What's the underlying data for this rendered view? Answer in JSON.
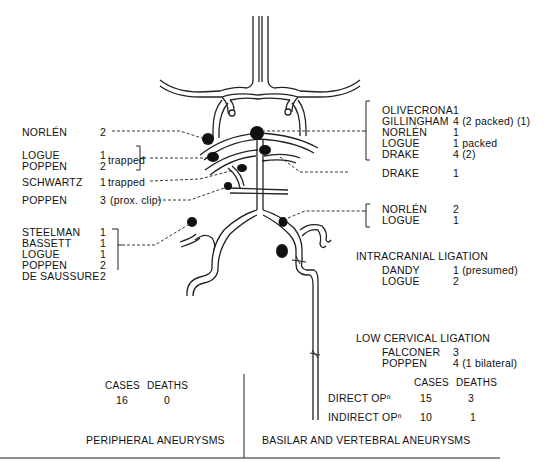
{
  "left_labels": [
    {
      "name": "NORLÉN",
      "count": "2",
      "note": ""
    },
    {
      "name": "LOGUE",
      "count": "1",
      "note": ""
    },
    {
      "name": "POPPEN",
      "count": "2",
      "note": ""
    },
    {
      "name": "SCHWARTZ",
      "count": "1",
      "note": "trapped"
    },
    {
      "name": "POPPEN",
      "count": "3",
      "note": "(prox. clip)"
    }
  ],
  "logue_poppen_note": "trapped",
  "left_group": [
    {
      "name": "STEELMAN",
      "count": "1"
    },
    {
      "name": "BASSETT",
      "count": "1"
    },
    {
      "name": "LOGUE",
      "count": "1"
    },
    {
      "name": "POPPEN",
      "count": "2"
    },
    {
      "name": "DE SAUSSURE",
      "count": "2"
    }
  ],
  "right_top_group": [
    {
      "name": "OLIVECRONA",
      "count": "1"
    },
    {
      "name": "GILLINGHAM",
      "count": "4 (2 packed) (1)"
    },
    {
      "name": "NORLÉN",
      "count": "1"
    },
    {
      "name": "LOGUE",
      "count": "1 packed"
    },
    {
      "name": "DRAKE",
      "count": "4 (2)"
    }
  ],
  "right_drake": {
    "name": "DRAKE",
    "count": "1"
  },
  "right_mid_group": [
    {
      "name": "NORLÉN",
      "count": "2"
    },
    {
      "name": "LOGUE",
      "count": "1"
    }
  ],
  "intracranial": {
    "title": "INTRACRANIAL LIGATION",
    "items": [
      {
        "name": "DANDY",
        "count": "1 (presumed)"
      },
      {
        "name": "LOGUE",
        "count": "2"
      }
    ]
  },
  "low_cervical": {
    "title": "LOW CERVICAL LIGATION",
    "items": [
      {
        "name": "FALCONER",
        "count": "3"
      },
      {
        "name": "POPPEN",
        "count": "4 (1 bilateral)"
      }
    ]
  },
  "summary": {
    "peripheral": {
      "cases_label": "CASES",
      "deaths_label": "DEATHS",
      "cases": "16",
      "deaths": "0",
      "title": "PERIPHERAL ANEURYSMS"
    },
    "basilar": {
      "cases_label": "CASES",
      "deaths_label": "DEATHS",
      "rows": [
        {
          "label": "DIRECT OPⁿ",
          "cases": "15",
          "deaths": "3"
        },
        {
          "label": "INDIRECT OPⁿ",
          "cases": "10",
          "deaths": "1"
        }
      ],
      "title": "BASILAR AND VERTEBRAL ANEURYSMS"
    }
  }
}
